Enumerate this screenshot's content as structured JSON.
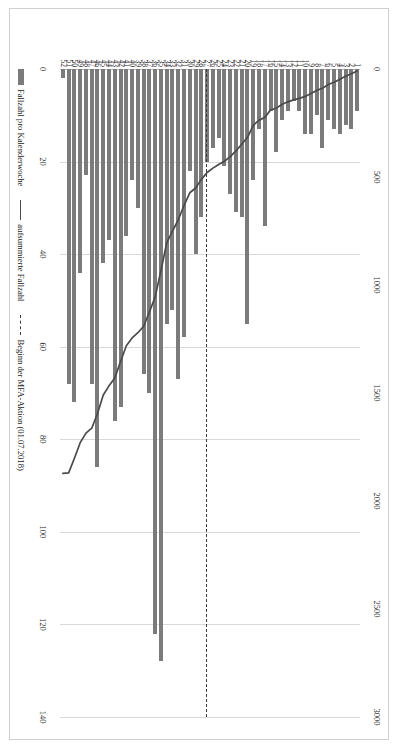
{
  "chart_data": {
    "type": "bar",
    "title": "",
    "xlabel": "",
    "ylabel": "",
    "orientation": "vertical",
    "grid": true,
    "legend_position": "bottom-left",
    "categories": [
      1,
      2,
      3,
      4,
      5,
      6,
      7,
      8,
      9,
      10,
      11,
      12,
      13,
      14,
      15,
      16,
      17,
      18,
      19,
      20,
      21,
      22,
      23,
      24,
      25,
      26,
      27,
      28,
      29,
      30,
      31,
      32,
      33,
      34,
      35,
      36,
      37,
      38,
      39,
      40,
      41,
      42,
      43,
      44,
      45,
      46,
      47,
      48,
      49,
      50,
      51,
      52
    ],
    "category_axis_label": "Kalenderwoche",
    "primary_axis": {
      "name": "Fallzahl pro Kalenderwoche",
      "ticks": [
        0,
        20,
        40,
        60,
        80,
        100,
        120,
        140
      ],
      "min": 0,
      "max": 140
    },
    "secondary_axis": {
      "name": "aufsummierte Fallzahl",
      "ticks": [
        0,
        500,
        1000,
        1500,
        2000,
        2500,
        3000
      ],
      "min": 0,
      "max": 3000
    },
    "series": [
      {
        "name": "Fallzahl pro Kalenderwoche",
        "type": "bar",
        "axis": "primary",
        "color": "#7b7b7b",
        "values": [
          9,
          13,
          12,
          14,
          13,
          11,
          17,
          10,
          14,
          14,
          9,
          7,
          9,
          11,
          18,
          9,
          34,
          13,
          24,
          55,
          32,
          31,
          27,
          21,
          15,
          17,
          20,
          32,
          40,
          22,
          58,
          67,
          52,
          55,
          128,
          122,
          70,
          66,
          30,
          24,
          36,
          73,
          76,
          37,
          42,
          86,
          68,
          23,
          44,
          72,
          68,
          2
        ]
      },
      {
        "name": "aufsummierte Fallzahl",
        "type": "line",
        "axis": "secondary",
        "color": "#4a4a4a",
        "values": [
          9,
          22,
          34,
          48,
          61,
          72,
          89,
          99,
          113,
          127,
          136,
          143,
          152,
          163,
          181,
          190,
          224,
          237,
          261,
          316,
          348,
          379,
          406,
          427,
          442,
          459,
          479,
          511,
          551,
          573,
          631,
          698,
          750,
          805,
          933,
          1055,
          1125,
          1191,
          1221,
          1245,
          1281,
          1354,
          1430,
          1467,
          1509,
          1595,
          1663,
          1686,
          1730,
          1802,
          1870,
          1872
        ]
      }
    ],
    "annotation": {
      "name": "Beginn der MFA-Aktion (01.07.2018)",
      "at_category": 26.5,
      "style": "dashed"
    },
    "legend": [
      {
        "label": "Fallzahl pro Kalenderwoche",
        "marker": "bar",
        "color": "#7b7b7b"
      },
      {
        "label": "aufsummierte Fallzahl",
        "marker": "line",
        "color": "#4a4a4a"
      },
      {
        "label": "Beginn der MFA-Aktion (01.07.2018)",
        "marker": "dashed",
        "color": "#3a3a3a"
      }
    ]
  }
}
